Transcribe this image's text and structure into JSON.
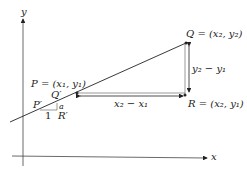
{
  "diagram": {
    "axes": {
      "x_label": "x",
      "y_label": "y"
    },
    "points": {
      "P": "P = (x₁, y₁)",
      "Q": "Q = (x₂, y₂)",
      "R": "R = (x₂, y₁)"
    },
    "differences": {
      "horizontal": "x₂ − x₁",
      "vertical": "y₂ − y₁"
    },
    "small_triangle": {
      "P_prime": "P′",
      "Q_prime": "Q′",
      "R_prime": "R′",
      "run": "1",
      "rise": "a"
    },
    "colors": {
      "stroke": "#222222",
      "background": "#ffffff"
    }
  }
}
